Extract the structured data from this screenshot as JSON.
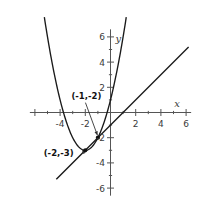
{
  "chart_data": {
    "type": "line",
    "title": "",
    "xlabel": "x",
    "ylabel": "y",
    "xlim": [
      -6.4,
      6.4
    ],
    "ylim": [
      -6.6,
      6.6
    ],
    "grid": false,
    "legend": "none",
    "x_ticks": [
      -6,
      -4,
      -2,
      2,
      4,
      6
    ],
    "x_tick_labels": [
      "",
      "-4",
      "-2",
      "2",
      "4",
      "6"
    ],
    "y_ticks": [
      -6,
      -4,
      -2,
      2,
      4,
      6
    ],
    "y_tick_labels": [
      "-6",
      "-4",
      "-2",
      "2",
      "4",
      "6"
    ],
    "series": [
      {
        "name": "parabola",
        "type": "quadratic",
        "equation": "y = x^2 + 4x + 1",
        "vertex": [
          -2,
          -3
        ],
        "roots": [
          -3.73,
          -0.27
        ],
        "color": "#1a1a1a"
      },
      {
        "name": "line",
        "type": "linear",
        "equation": "y = x - 1",
        "slope": 1,
        "intercept": -1,
        "x_intercept": 1,
        "color": "#1a1a1a"
      }
    ],
    "intersection_points": [
      {
        "label": "(-1,-2)",
        "x": -1,
        "y": -2
      },
      {
        "label": "(-2,-3)",
        "x": -2,
        "y": -3
      }
    ],
    "annotations": [
      {
        "name": "upper-point-annotation",
        "text": "(-1,-2)",
        "label_x": -3.1,
        "label_y": 1.1,
        "leader_to_x": -1,
        "leader_to_y": -2
      },
      {
        "name": "lower-point-annotation",
        "text": "(-2,-3)",
        "label_x": -5.3,
        "label_y": -3.45,
        "leader_to_x": -2,
        "leader_to_y": -3
      }
    ]
  },
  "axis_labels": {
    "x": "x",
    "y": "y"
  },
  "ticks": {
    "x": [
      {
        "value": -6,
        "label": ""
      },
      {
        "value": -4,
        "label": "-4"
      },
      {
        "value": -2,
        "label": "-2"
      },
      {
        "value": 2,
        "label": "2"
      },
      {
        "value": 4,
        "label": "4"
      },
      {
        "value": 6,
        "label": "6"
      }
    ],
    "y": [
      {
        "value": 6,
        "label": "6"
      },
      {
        "value": 4,
        "label": "4"
      },
      {
        "value": 2,
        "label": "2"
      },
      {
        "value": -2,
        "label": "-2"
      },
      {
        "value": -4,
        "label": "-4"
      },
      {
        "value": -6,
        "label": "-6"
      }
    ]
  },
  "points": [
    {
      "name": "point-neg1-neg2",
      "label": "(-1,-2)",
      "x": -1,
      "y": -2
    },
    {
      "name": "point-neg2-neg3",
      "label": "(-2,-3)",
      "x": -2,
      "y": -3
    }
  ],
  "colors": {
    "curve": "#1a1a1a",
    "axis": "#555555",
    "text": "#2b2b2b",
    "background": "#ffffff"
  }
}
